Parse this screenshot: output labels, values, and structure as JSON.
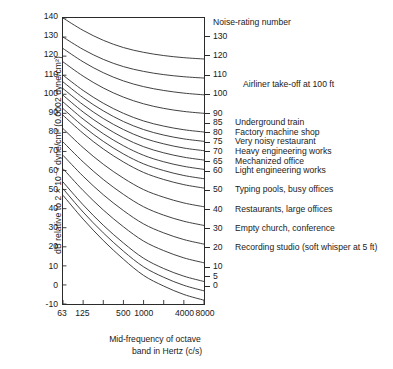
{
  "chart_data": {
    "type": "line",
    "title": "",
    "xlabel": "Mid-frequency of octave band in Hertz (c/s)",
    "ylabel": "dB relative to 2 × 10⁻⁴ dyne/cm² (0.0002 dyne/cm²)",
    "ylim": [
      -10,
      140
    ],
    "yticks": [
      140,
      130,
      120,
      110,
      100,
      90,
      80,
      70,
      60,
      50,
      40,
      30,
      20,
      10,
      0,
      -10
    ],
    "x": [
      63,
      125,
      250,
      500,
      1000,
      2000,
      4000,
      8000
    ],
    "xtick_labels": [
      "63",
      "125",
      "",
      "500",
      "1000",
      "",
      "4000",
      "8000"
    ],
    "xtick_labels_shown": [
      "63",
      "125",
      "500",
      "1000",
      "4000",
      "8000"
    ],
    "grid": false,
    "legend": "none",
    "series_label": "Noise-rating number",
    "series": [
      {
        "name": "130",
        "values": [
          140.0,
          133.5,
          128.3,
          124.5,
          122.0,
          120.3,
          119.2,
          118.5
        ]
      },
      {
        "name": "120",
        "values": [
          130.0,
          123.5,
          118.3,
          114.5,
          112.0,
          110.3,
          109.2,
          108.5
        ]
      },
      {
        "name": "110",
        "values": [
          124.0,
          117.0,
          111.3,
          107.0,
          104.0,
          102.0,
          100.6,
          99.7
        ]
      },
      {
        "name": "100",
        "values": [
          117.0,
          109.5,
          103.3,
          98.5,
          95.0,
          92.6,
          91.0,
          90.0
        ]
      },
      {
        "name": "90",
        "values": [
          110.0,
          102.0,
          95.3,
          90.0,
          86.0,
          83.3,
          81.4,
          80.2
        ]
      },
      {
        "name": "85",
        "values": [
          106.5,
          98.2,
          91.3,
          85.7,
          81.5,
          78.6,
          76.6,
          75.3
        ]
      },
      {
        "name": "80",
        "values": [
          103.0,
          94.5,
          87.3,
          81.5,
          77.0,
          74.0,
          71.8,
          70.4
        ]
      },
      {
        "name": "75",
        "values": [
          99.5,
          90.7,
          83.3,
          77.2,
          72.5,
          69.3,
          67.0,
          65.5
        ]
      },
      {
        "name": "70",
        "values": [
          96.0,
          87.0,
          79.3,
          73.0,
          68.0,
          64.6,
          62.2,
          60.6
        ]
      },
      {
        "name": "65",
        "values": [
          92.5,
          83.2,
          75.3,
          68.7,
          63.5,
          60.0,
          57.4,
          55.7
        ]
      },
      {
        "name": "60",
        "values": [
          89.0,
          79.5,
          71.3,
          64.5,
          59.0,
          55.3,
          52.6,
          50.8
        ]
      },
      {
        "name": "50",
        "values": [
          82.0,
          72.0,
          63.3,
          56.0,
          50.0,
          46.0,
          43.0,
          41.0
        ]
      },
      {
        "name": "40",
        "values": [
          75.0,
          64.5,
          55.3,
          47.5,
          41.0,
          36.6,
          33.4,
          31.2
        ]
      },
      {
        "name": "30",
        "values": [
          68.0,
          57.0,
          47.3,
          39.0,
          32.0,
          27.3,
          23.8,
          21.4
        ]
      },
      {
        "name": "20",
        "values": [
          61.0,
          49.5,
          39.3,
          30.5,
          23.0,
          18.0,
          14.2,
          11.6
        ]
      },
      {
        "name": "10",
        "values": [
          54.0,
          42.0,
          31.3,
          22.0,
          14.0,
          8.6,
          4.6,
          1.8
        ]
      },
      {
        "name": "5",
        "values": [
          50.5,
          38.2,
          27.3,
          17.7,
          9.5,
          4.0,
          -0.2,
          -3.1
        ]
      },
      {
        "name": "0",
        "values": [
          47.0,
          34.5,
          23.3,
          13.5,
          5.0,
          -0.6,
          -5.0,
          -8.0
        ]
      }
    ]
  },
  "annotations": {
    "header": "Noise-rating number",
    "items": [
      {
        "rating": "130",
        "desc": ""
      },
      {
        "rating": "120",
        "desc": ""
      },
      {
        "rating": "110",
        "desc": ""
      },
      {
        "rating": "",
        "desc": "Airliner take-off at 100 ft"
      },
      {
        "rating": "100",
        "desc": ""
      },
      {
        "rating": "90",
        "desc": ""
      },
      {
        "rating": "85",
        "desc": "Underground train"
      },
      {
        "rating": "80",
        "desc": "Factory machine shop"
      },
      {
        "rating": "75",
        "desc": "Very noisy restaurant"
      },
      {
        "rating": "70",
        "desc": "Heavy engineering works"
      },
      {
        "rating": "65",
        "desc": "Mechanized office"
      },
      {
        "rating": "60",
        "desc": "Light engineering works"
      },
      {
        "rating": "50",
        "desc": "Typing pools, busy offices"
      },
      {
        "rating": "40",
        "desc": "Restaurants, large offices"
      },
      {
        "rating": "30",
        "desc": "Empty church, conference"
      },
      {
        "rating": "20",
        "desc": "Recording studio (soft whisper at 5 ft)"
      },
      {
        "rating": "10",
        "desc": ""
      },
      {
        "rating": "5",
        "desc": ""
      },
      {
        "rating": "0",
        "desc": ""
      }
    ]
  },
  "style": {
    "curve_color": "#2b2b2b",
    "axis_color": "#2b2b2b",
    "background": "#ffffff"
  }
}
